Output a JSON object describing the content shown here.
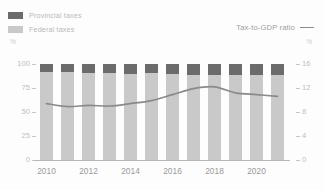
{
  "legend": {
    "series": [
      {
        "key": "provincial",
        "label": "Provincial taxes",
        "color": "#6b6b6b",
        "swatch": "square-swatch"
      },
      {
        "key": "federal",
        "label": "Federal taxes",
        "color": "#c9c9c9",
        "swatch": "square-swatch"
      }
    ],
    "line_entry": {
      "key": "ratio",
      "label": "Tax-to-GDP ratio",
      "color": "#8a8a8a",
      "swatch": "line-swatch"
    }
  },
  "axes": {
    "left_unit": "%",
    "right_unit": "%",
    "left_ticks": [
      "100",
      "75",
      "50",
      "25",
      "0"
    ],
    "right_ticks": [
      "16",
      "12",
      "8",
      "4",
      "0"
    ],
    "x_ticks": [
      "2010",
      "2012",
      "2014",
      "2016",
      "2018",
      "2020"
    ]
  },
  "chart_data": {
    "type": "bar",
    "title": "",
    "subtitle": "",
    "xlabel": "",
    "ylabel": "%",
    "y2label": "%",
    "ylim": [
      0,
      100
    ],
    "y2lim": [
      0,
      16
    ],
    "grid": false,
    "legend_position": "top",
    "categories": [
      "2010",
      "2011",
      "2012",
      "2013",
      "2014",
      "2015",
      "2016",
      "2017",
      "2018",
      "2019",
      "2020",
      "2021"
    ],
    "x_tick_labels": [
      "2010",
      "",
      "2012",
      "",
      "2014",
      "",
      "2016",
      "",
      "2018",
      "",
      "2020",
      ""
    ],
    "stacked": true,
    "series": [
      {
        "name": "Federal taxes",
        "type": "bar",
        "axis": "left",
        "color": "#c9c9c9",
        "values": [
          92.0,
          91.5,
          90.8,
          90.5,
          90.0,
          90.2,
          89.2,
          89.0,
          88.5,
          89.0,
          88.6,
          88.2
        ]
      },
      {
        "name": "Provincial taxes",
        "type": "bar",
        "axis": "left",
        "color": "#6b6b6b",
        "values": [
          8.0,
          8.5,
          9.2,
          9.5,
          10.0,
          9.8,
          10.8,
          11.0,
          11.5,
          11.0,
          11.4,
          11.8
        ]
      },
      {
        "name": "Tax-to-GDP ratio",
        "type": "line",
        "axis": "right",
        "color": "#8a8a8a",
        "values": [
          9.4,
          8.9,
          9.1,
          9.0,
          9.4,
          9.9,
          10.9,
          11.9,
          12.2,
          11.2,
          10.9,
          10.6
        ]
      }
    ]
  }
}
